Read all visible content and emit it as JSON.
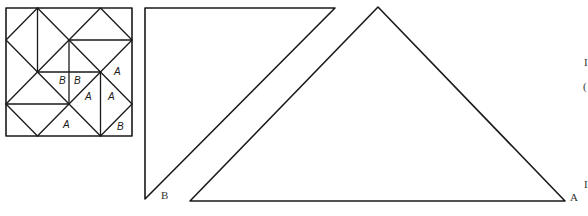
{
  "figure": {
    "quilt_block": {
      "description": "4x4 quilt block pattern with triangular pieces",
      "piece_labels": [
        {
          "text": "B",
          "x": 59,
          "y": 84
        },
        {
          "text": "B",
          "x": 75,
          "y": 84
        },
        {
          "text": "A",
          "x": 117,
          "y": 74
        },
        {
          "text": "A",
          "x": 86,
          "y": 98
        },
        {
          "text": "A",
          "x": 111,
          "y": 98
        },
        {
          "text": "A",
          "x": 65,
          "y": 125
        },
        {
          "text": "B",
          "x": 119,
          "y": 129
        }
      ]
    },
    "template_b": {
      "label": "B",
      "shape": "right triangle",
      "vertices": [
        [
          145,
          8
        ],
        [
          335,
          8
        ],
        [
          145,
          199
        ]
      ]
    },
    "template_a": {
      "label": "A",
      "shape": "isosceles right triangle",
      "vertices": [
        [
          378,
          7
        ],
        [
          565,
          201
        ],
        [
          190,
          201
        ]
      ]
    },
    "edge_fragments": [
      {
        "text": "I",
        "x": 584,
        "y": 66
      },
      {
        "text": "(",
        "x": 583,
        "y": 88
      },
      {
        "text": "I",
        "x": 584,
        "y": 186
      }
    ]
  }
}
